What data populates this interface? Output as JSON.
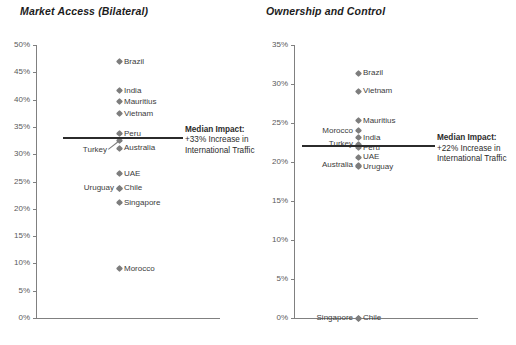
{
  "charts": [
    {
      "title": "Market Access (Bilateral)",
      "axis": {
        "max": 50,
        "min": 0,
        "step": 5,
        "ticks": [
          "50%",
          "45%",
          "40%",
          "35%",
          "30%",
          "25%",
          "20%",
          "15%",
          "10%",
          "5%",
          "0%"
        ]
      },
      "median": {
        "value": 33,
        "header": "Median Impact:",
        "line2": "+33% Increase in",
        "line3": "International Traffic"
      },
      "points": [
        {
          "name": "Brazil",
          "value": 46.9,
          "side": "right"
        },
        {
          "name": "India",
          "value": 41.6,
          "side": "right"
        },
        {
          "name": "Mauritius",
          "value": 39.6,
          "side": "right"
        },
        {
          "name": "Vietnam",
          "value": 37.4,
          "side": "right"
        },
        {
          "name": "Peru",
          "value": 33.7,
          "side": "right"
        },
        {
          "name": "Turkey",
          "value": 32.6,
          "side": "leader"
        },
        {
          "name": "Australia",
          "value": 31.1,
          "side": "right"
        },
        {
          "name": "UAE",
          "value": 26.4,
          "side": "right"
        },
        {
          "name": "Chile",
          "value": 23.8,
          "side": "right"
        },
        {
          "name": "Uruguay",
          "value": 23.8,
          "side": "left"
        },
        {
          "name": "Singapore",
          "value": 21.1,
          "side": "right"
        },
        {
          "name": "Morocco",
          "value": 9.0,
          "side": "right"
        }
      ]
    },
    {
      "title": "Ownership and Control",
      "axis": {
        "max": 35,
        "min": 0,
        "step": 5,
        "ticks": [
          "35%",
          "30%",
          "25%",
          "20%",
          "15%",
          "10%",
          "5%",
          "0%"
        ]
      },
      "median": {
        "value": 22,
        "header": "Median Impact:",
        "line2": "+22% Increase in",
        "line3": "International Traffic"
      },
      "points": [
        {
          "name": "Brazil",
          "value": 31.4,
          "side": "right"
        },
        {
          "name": "Vietnam",
          "value": 29.1,
          "side": "right"
        },
        {
          "name": "Mauritius",
          "value": 25.3,
          "side": "right"
        },
        {
          "name": "Morocco",
          "value": 24.0,
          "side": "left"
        },
        {
          "name": "India",
          "value": 23.1,
          "side": "right"
        },
        {
          "name": "Turkey",
          "value": 22.3,
          "side": "left"
        },
        {
          "name": "Peru",
          "value": 21.8,
          "side": "right"
        },
        {
          "name": "UAE",
          "value": 20.6,
          "side": "right"
        },
        {
          "name": "Australia",
          "value": 19.6,
          "side": "left"
        },
        {
          "name": "Uruguay",
          "value": 19.4,
          "side": "right"
        },
        {
          "name": "Singapore",
          "value": 0.0,
          "side": "left"
        },
        {
          "name": "Chile",
          "value": 0.0,
          "side": "right"
        }
      ]
    }
  ],
  "chart_data": {
    "type": "scatter",
    "panels": [
      {
        "title": "Market Access (Bilateral)",
        "ylabel": "",
        "xlabel": "",
        "ylim": [
          0,
          50
        ],
        "ytick_labels": [
          "0%",
          "5%",
          "10%",
          "15%",
          "20%",
          "25%",
          "30%",
          "35%",
          "40%",
          "45%",
          "50%"
        ],
        "grid": false,
        "categories": [
          "Brazil",
          "India",
          "Mauritius",
          "Vietnam",
          "Peru",
          "Turkey",
          "Australia",
          "UAE",
          "Chile",
          "Uruguay",
          "Singapore",
          "Morocco"
        ],
        "values": [
          46.9,
          41.6,
          39.6,
          37.4,
          33.7,
          32.6,
          31.1,
          26.4,
          23.8,
          23.8,
          21.1,
          9.0
        ],
        "median_line": 33,
        "annotation": "Median Impact: +33% Increase in International Traffic"
      },
      {
        "title": "Ownership and Control",
        "ylabel": "",
        "xlabel": "",
        "ylim": [
          0,
          35
        ],
        "ytick_labels": [
          "0%",
          "5%",
          "10%",
          "15%",
          "20%",
          "25%",
          "30%",
          "35%"
        ],
        "grid": false,
        "categories": [
          "Brazil",
          "Vietnam",
          "Mauritius",
          "Morocco",
          "India",
          "Turkey",
          "Peru",
          "UAE",
          "Australia",
          "Uruguay",
          "Singapore",
          "Chile"
        ],
        "values": [
          31.4,
          29.1,
          25.3,
          24.0,
          23.1,
          22.3,
          21.8,
          20.6,
          19.6,
          19.4,
          0.0,
          0.0
        ],
        "median_line": 22,
        "annotation": "Median Impact: +22% Increase in International Traffic"
      }
    ],
    "legend_position": "none",
    "colors": {
      "marker": "#7d7d7d",
      "median": "#2b2b2b",
      "axis": "#808080"
    }
  }
}
